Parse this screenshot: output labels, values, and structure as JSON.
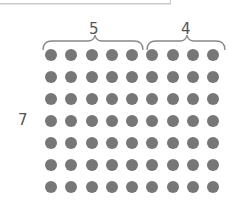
{
  "diagram": {
    "type": "dot-array",
    "rows": 7,
    "columns": 9,
    "groups": [
      {
        "label": "5",
        "columns": 5
      },
      {
        "label": "4",
        "columns": 4
      }
    ],
    "row_label": "7",
    "dot_color": "#777777",
    "label_color": "#555555"
  }
}
